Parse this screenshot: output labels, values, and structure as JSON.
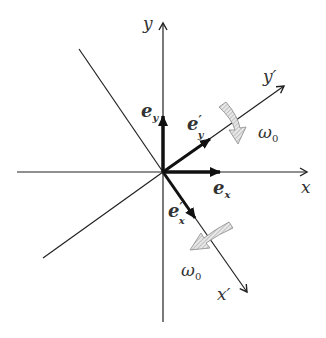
{
  "diagram": {
    "type": "rotating-coordinate-frames",
    "origin": [
      163,
      172
    ],
    "axes": {
      "x": {
        "label": "x"
      },
      "y": {
        "label": "y"
      },
      "x_prime": {
        "label": "x",
        "prime": "′"
      },
      "y_prime": {
        "label": "y",
        "prime": "′"
      }
    },
    "unit_vectors": {
      "e_x": {
        "base": "e",
        "sub": "x"
      },
      "e_y": {
        "base": "e",
        "sub": "y"
      },
      "e_x_prime": {
        "base": "e",
        "prime": "′",
        "sub": "x"
      },
      "e_y_prime": {
        "base": "e",
        "prime": "′",
        "sub": "y"
      }
    },
    "rotation": {
      "label_base": "ω",
      "label_sub": "0",
      "arrow_count": 2
    },
    "colors": {
      "line": "#222222",
      "rotation_arrow_fill": "#d8d8d8",
      "rotation_arrow_stroke": "#888888"
    }
  }
}
